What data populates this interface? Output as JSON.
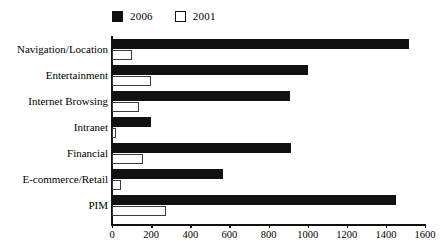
{
  "chart_data": {
    "type": "bar",
    "orientation": "horizontal",
    "title": "",
    "subtitle": "",
    "xlabel": "",
    "ylabel": "",
    "xlim": [
      0,
      1600
    ],
    "ylim": null,
    "grid": false,
    "legend_position": "top-left",
    "categories": [
      "Navigation/Location",
      "Entertainment",
      "Internet Browsing",
      "Intranet",
      "Financial",
      "E-commerce/Retail",
      "PIM"
    ],
    "series": [
      {
        "name": "2006",
        "color": "#111111",
        "style": "filled",
        "values": [
          1520,
          1000,
          910,
          200,
          915,
          565,
          1450
        ]
      },
      {
        "name": "2001",
        "color": "#ffffff",
        "style": "hollow",
        "values": [
          100,
          200,
          140,
          20,
          160,
          45,
          275
        ]
      }
    ],
    "xticks": [
      0,
      200,
      400,
      600,
      800,
      1000,
      1200,
      1400,
      1600
    ],
    "xtick_labels": [
      "0",
      "200",
      "400",
      "600",
      "800",
      "1000",
      "1200",
      "1400",
      "1600"
    ]
  },
  "legend": {
    "entries": [
      {
        "label": "2006",
        "swatch": "filled-square-icon"
      },
      {
        "label": "2001",
        "swatch": "hollow-square-icon"
      }
    ]
  },
  "colors": {
    "series_2006": "#111111",
    "series_2001_fill": "#ffffff",
    "series_2001_stroke": "#3a3a3a",
    "axis": "#111111",
    "background": "#ffffff",
    "text": "#000000"
  }
}
